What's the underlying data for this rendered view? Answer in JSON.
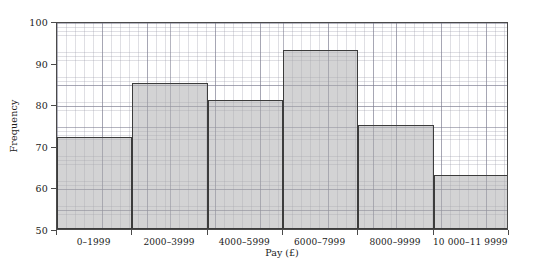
{
  "chart_data": {
    "type": "bar",
    "title": "",
    "subtitle": "",
    "xlabel": "Pay (£)",
    "ylabel": "Frequency",
    "categories": [
      "0–1999",
      "2000–3999",
      "4000–5999",
      "6000–7999",
      "8000–9999",
      "10 000–11 9999"
    ],
    "values": [
      72,
      85,
      81,
      93,
      75,
      63
    ],
    "ylim": [
      50,
      100
    ],
    "ytick_labels": [
      "50",
      "60",
      "70",
      "80",
      "90",
      "100"
    ],
    "ytick_values": [
      50,
      60,
      70,
      80,
      90,
      100
    ],
    "grid": true,
    "grid_minor": true,
    "legend": null,
    "legend_position": "none",
    "annotations": [],
    "colors": {
      "bar_fill": "#aaaaac",
      "bar_edge": "#3c3c3c",
      "grid_minor": "#9696a5",
      "grid_major": "#78788c",
      "axis": "#4a4a4a",
      "text": "#1a1a1a",
      "background": "#ffffff"
    }
  }
}
